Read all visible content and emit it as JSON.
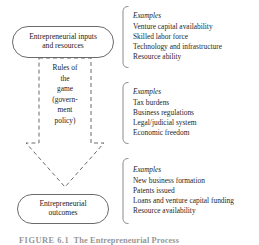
{
  "figure": {
    "caption_label": "FIGURE 6.1",
    "caption_title": "The Entrepreneurial Process",
    "line_color": "#6b6b6b",
    "bracket_color": "#8a8a8a",
    "text_color": "#1f1f1f"
  },
  "flow": {
    "inputs": {
      "label": "Entrepreneurial inputs\nand resources"
    },
    "rules": {
      "label": "Rules of\nthe\ngame\n(govern-\nment\npolicy)"
    },
    "outcomes": {
      "label": "Entrepreneurial\noutcomes"
    }
  },
  "examples": [
    {
      "heading": "Examples",
      "items": [
        "Venture capital availability",
        "Skilled labor force",
        "Technology and infrastructure",
        "Resource ability"
      ]
    },
    {
      "heading": "Examples",
      "items": [
        "Tax burdens",
        "Business regulations",
        "Legal/judicial system",
        "Economic freedom"
      ]
    },
    {
      "heading": "Examples",
      "items": [
        "New business formation",
        "Patents issued",
        "Loans and venture capital funding",
        "Resource availability"
      ]
    }
  ]
}
